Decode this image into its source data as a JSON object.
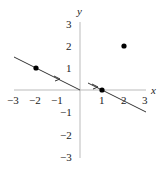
{
  "diagram": {
    "axes": {
      "x_label": "x",
      "y_label": "y",
      "x_ticks": [
        "−3",
        "−2",
        "−1",
        "1",
        "2",
        "3"
      ],
      "x_tick_values": [
        -3,
        -2,
        -1,
        1,
        2,
        3
      ],
      "y_ticks": [
        "3",
        "2",
        "1",
        "−1",
        "−2",
        "−3"
      ],
      "y_tick_values": [
        3,
        2,
        1,
        -1,
        -2,
        -3
      ],
      "range": {
        "x": [
          -3,
          3
        ],
        "y": [
          -3,
          3
        ]
      }
    },
    "points": [
      {
        "x": -2,
        "y": 1
      },
      {
        "x": 1,
        "y": 0
      },
      {
        "x": 2,
        "y": 2
      }
    ],
    "lines": [
      {
        "from": [
          -3.0,
          1.5
        ],
        "to": [
          0,
          0
        ],
        "slope": -0.5,
        "arrow_at": [
          -1,
          0.5
        ]
      },
      {
        "from": [
          0.35,
          0.33
        ],
        "to": [
          3,
          -1
        ],
        "slope": -0.5,
        "arrow_at": [
          0.7,
          0.15
        ]
      }
    ],
    "colors": {
      "axis": "#bbbbbb",
      "line": "#333333",
      "point": "#000000"
    }
  }
}
